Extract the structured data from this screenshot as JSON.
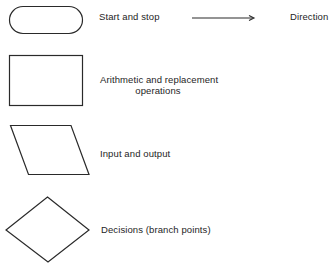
{
  "diagram": {
    "stroke_color": "#2a2a2a",
    "symbols": [
      {
        "shape": "terminal",
        "label": "Start and stop"
      },
      {
        "shape": "rectangle",
        "label_line1": "Arithmetic and replacement",
        "label_line2": "operations"
      },
      {
        "shape": "parallelogram",
        "label": "Input and output"
      },
      {
        "shape": "diamond",
        "label": "Decisions (branch points)"
      }
    ],
    "direction": {
      "shape": "arrow",
      "label": "Direction"
    }
  }
}
